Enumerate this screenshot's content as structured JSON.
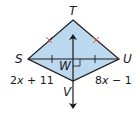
{
  "diagram": {
    "type": "kite",
    "colors": {
      "fill": "#bcd8ee",
      "stroke": "#1a1a1a",
      "congruence_tick": "#d04a3a"
    },
    "vertices": {
      "T": {
        "label": "T"
      },
      "S": {
        "label": "S"
      },
      "U": {
        "label": "U"
      },
      "V": {
        "label": "V"
      },
      "W": {
        "label": "W"
      }
    },
    "side_labels": {
      "SV": {
        "coef": "2",
        "var": "x",
        "rest": " + 11"
      },
      "UV": {
        "coef": "8",
        "var": "x",
        "rest": " − 1"
      }
    },
    "annotations": {
      "ST_TU_congruent": true,
      "SW_WU_congruent": true,
      "right_angle_at": "W",
      "perpendicular_line": "TV (double arrow)"
    }
  }
}
